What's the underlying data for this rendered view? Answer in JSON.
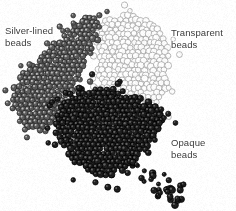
{
  "figure": {
    "name": "bead-types-photograph",
    "kind": "grayscale-photograph",
    "width": 236,
    "height": 211,
    "background_color": "#ffffff"
  },
  "captions": [
    {
      "id": "silver-lined",
      "text": "Silver-lined\nbeads",
      "line1": "Silver-lined",
      "line2": "beads",
      "color": "#3b3b3b",
      "x": 5,
      "y": 25
    },
    {
      "id": "transparent",
      "text": "Transparent\nbeads",
      "line1": "Transparent",
      "line2": "beads",
      "color": "#3b3b3b",
      "x": 171,
      "y": 27
    },
    {
      "id": "opaque",
      "text": "Opaque\nbeads",
      "line1": "Opaque",
      "line2": "beads",
      "color": "#3b3b3b",
      "x": 171,
      "y": 137
    }
  ],
  "bead_groups": [
    {
      "id": "silver-lined",
      "label": "Silver-lined beads",
      "fill_color": "#5a5a5a",
      "outline_color": "#222222",
      "highlight_color": "#cfcfcf",
      "bead_radius": 3.0,
      "spacing": 5.0,
      "density": 1.0,
      "scatter_count": 30,
      "region_polygon": [
        [
          88,
          14
        ],
        [
          104,
          22
        ],
        [
          96,
          48
        ],
        [
          84,
          70
        ],
        [
          72,
          96
        ],
        [
          58,
          122
        ],
        [
          40,
          136
        ],
        [
          22,
          126
        ],
        [
          10,
          104
        ],
        [
          12,
          86
        ],
        [
          26,
          68
        ],
        [
          46,
          50
        ],
        [
          66,
          30
        ]
      ]
    },
    {
      "id": "transparent",
      "label": "Transparent beads",
      "fill_color": "#fbfbfb",
      "outline_color": "#9a9a9a",
      "highlight_color": "#ffffff",
      "bead_radius": 3.2,
      "spacing": 5.2,
      "density": 0.95,
      "scatter_count": 26,
      "region_polygon": [
        [
          104,
          18
        ],
        [
          128,
          12
        ],
        [
          152,
          20
        ],
        [
          166,
          40
        ],
        [
          172,
          66
        ],
        [
          168,
          92
        ],
        [
          156,
          110
        ],
        [
          136,
          114
        ],
        [
          114,
          104
        ],
        [
          98,
          84
        ],
        [
          92,
          58
        ],
        [
          96,
          34
        ]
      ]
    },
    {
      "id": "opaque",
      "label": "Opaque beads",
      "fill_color": "#1d1d1d",
      "outline_color": "#000000",
      "highlight_color": "#6e6e6e",
      "bead_radius": 3.1,
      "spacing": 4.9,
      "density": 1.0,
      "scatter_count": 42,
      "region_polygon": [
        [
          84,
          86
        ],
        [
          120,
          92
        ],
        [
          150,
          100
        ],
        [
          164,
          114
        ],
        [
          160,
          132
        ],
        [
          150,
          150
        ],
        [
          134,
          164
        ],
        [
          114,
          176
        ],
        [
          96,
          178
        ],
        [
          78,
          166
        ],
        [
          62,
          148
        ],
        [
          52,
          130
        ],
        [
          56,
          112
        ],
        [
          68,
          96
        ]
      ]
    }
  ],
  "scatter_tail": {
    "id": "opaque-tail",
    "label": "scattered opaque beads",
    "color": "#1d1d1d",
    "count": 34,
    "start": [
      132,
      160
    ],
    "end": [
      178,
      200
    ]
  },
  "colors": {
    "background": "#ffffff",
    "caption_text": "#3b3b3b",
    "silver_lined": "#5a5a5a",
    "transparent": "#e8e8e8",
    "opaque": "#1d1d1d"
  }
}
